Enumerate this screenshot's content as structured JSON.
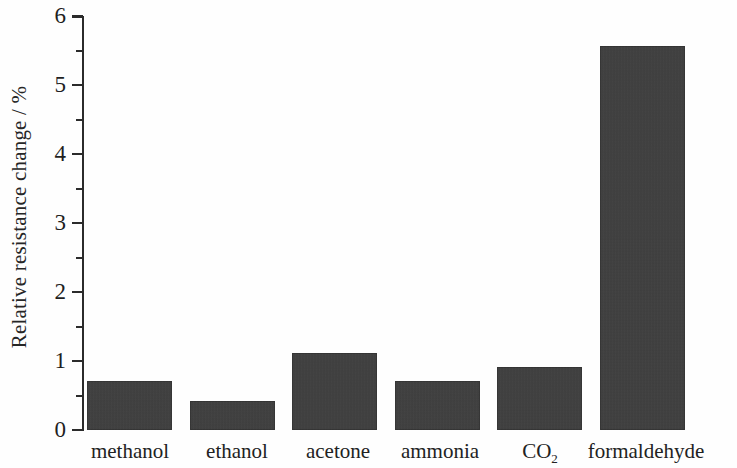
{
  "chart_data": {
    "type": "bar",
    "title": "",
    "subtitle": "",
    "xlabel": "",
    "ylabel": "Relative resistance change / %",
    "categories": [
      "methanol",
      "ethanol",
      "acetone",
      "ammonia",
      "CO2",
      "formaldehyde"
    ],
    "category_labels_html": [
      "methanol",
      "ethanol",
      "acetone",
      "ammonia",
      "CO₂",
      "formaldehyde"
    ],
    "values": [
      0.71,
      0.42,
      1.12,
      0.71,
      0.92,
      5.57
    ],
    "ylim": [
      0,
      6
    ],
    "ytick_labels": [
      "0",
      "1",
      "2",
      "3",
      "4",
      "5",
      "6"
    ],
    "ytick_values": [
      0,
      1,
      2,
      3,
      4,
      5,
      6
    ],
    "yminor_tick_values": [
      0.5,
      1.5,
      2.5,
      3.5,
      4.5,
      5.5
    ],
    "grid": false,
    "legend": false,
    "legend_position": "none",
    "bar_color": "#3d3d3d",
    "axis_color": "#2b2b2b",
    "background_color": "#ffffff"
  },
  "axis": {
    "y_title": "Relative resistance change / %"
  },
  "ticks": {
    "t0": "0",
    "t1": "1",
    "t2": "2",
    "t3": "3",
    "t4": "4",
    "t5": "5",
    "t6": "6"
  },
  "xlabels": {
    "methanol": "methanol",
    "ethanol": "ethanol",
    "acetone": "acetone",
    "ammonia": "ammonia",
    "co2_main": "CO",
    "co2_sub": "2",
    "formaldehyde": "formaldehyde"
  }
}
